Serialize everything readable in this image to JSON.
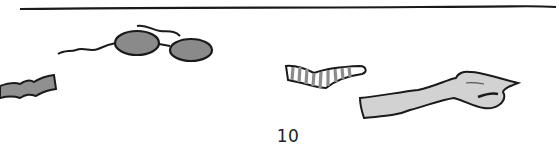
{
  "page": {
    "page_number": "10",
    "illustration": {
      "description": "Hand-drawn items scattered on a surface below a horizontal line",
      "items": [
        "wavy-strip",
        "sunglasses",
        "striped-sock",
        "glove"
      ]
    },
    "colors": {
      "ink": "#1a1a1a",
      "lens_fill": "#8a8a8a",
      "strip_fill": "#909090",
      "sock_stripe": "#8c8c8c",
      "glove_fill": "#d2d2d2"
    }
  }
}
